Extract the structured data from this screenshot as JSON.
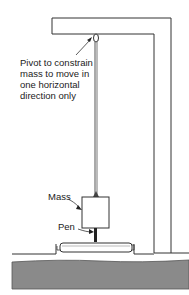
{
  "diagram": {
    "labels": {
      "pivot_line1": "Pivot to constrain",
      "pivot_line2": "mass to move in",
      "pivot_line3": "one horizontal",
      "pivot_line4": "direction only",
      "mass": "Mass",
      "pen": "Pen"
    },
    "colors": {
      "line": "#333333",
      "ground": "#8a8a8a",
      "background": "#ffffff"
    },
    "components": [
      "frame",
      "pivot",
      "suspension-wire",
      "mass",
      "pen",
      "recording-drum",
      "ground"
    ]
  }
}
